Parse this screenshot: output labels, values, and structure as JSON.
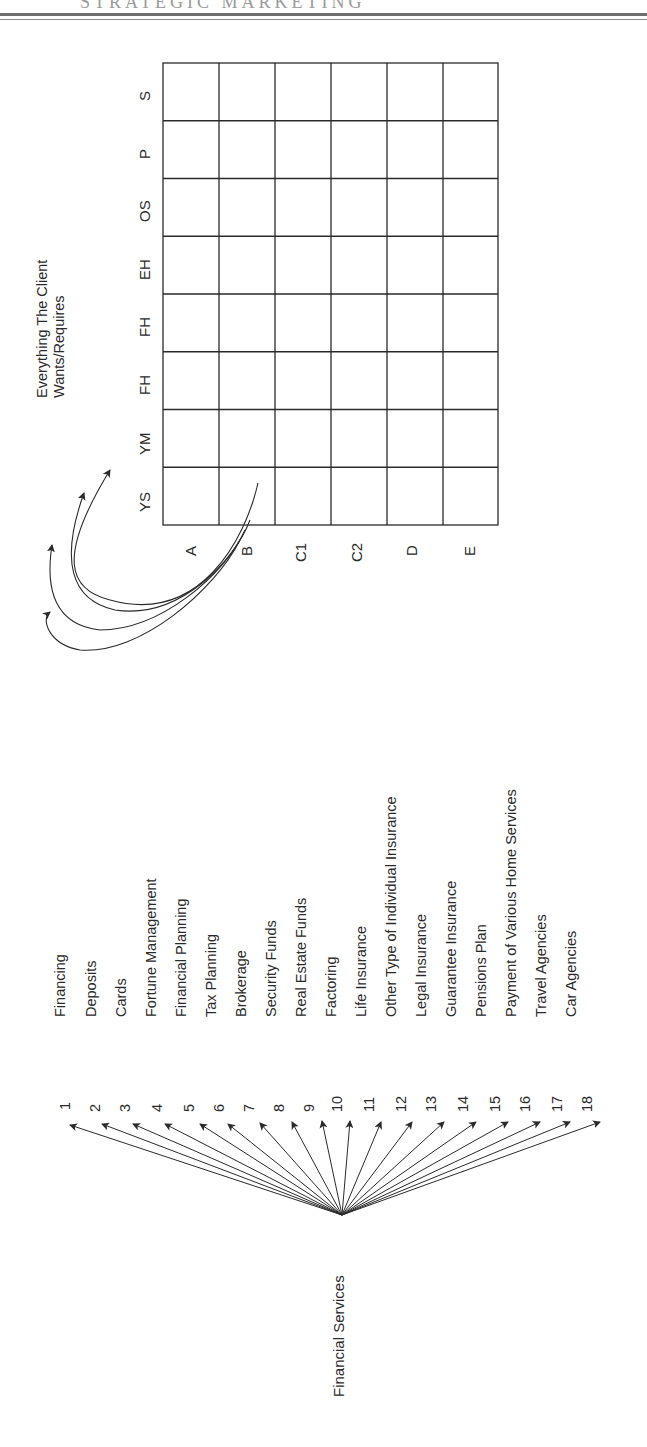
{
  "header": {
    "ghost_text": "STRATEGIC MARKETING"
  },
  "matrix": {
    "caption_line1": "Everything The Client",
    "caption_line2": "Wants/Requires",
    "row_labels": [
      "S",
      "P",
      "OS",
      "EH",
      "FH",
      "FH",
      "YM",
      "YS"
    ],
    "column_labels": [
      "A",
      "B",
      "C1",
      "C2",
      "D",
      "E"
    ]
  },
  "services": {
    "root_label": "Financial Services",
    "items": [
      {
        "number": "1",
        "label": "Financing"
      },
      {
        "number": "2",
        "label": "Deposits"
      },
      {
        "number": "3",
        "label": "Cards"
      },
      {
        "number": "4",
        "label": "Fortune Management"
      },
      {
        "number": "5",
        "label": "Financial Planning"
      },
      {
        "number": "6",
        "label": "Tax Planning"
      },
      {
        "number": "7",
        "label": "Brokerage"
      },
      {
        "number": "8",
        "label": "Security Funds"
      },
      {
        "number": "9",
        "label": "Real Estate Funds"
      },
      {
        "number": "10",
        "label": "Factoring"
      },
      {
        "number": "11",
        "label": "Life Insurance"
      },
      {
        "number": "12",
        "label": "Other Type of Individual Insurance"
      },
      {
        "number": "13",
        "label": "Legal Insurance"
      },
      {
        "number": "14",
        "label": "Guarantee Insurance"
      },
      {
        "number": "15",
        "label": "Pensions Plan"
      },
      {
        "number": "16",
        "label": "Payment of Various Home Services"
      },
      {
        "number": "17",
        "label": "Travel Agencies"
      },
      {
        "number": "18",
        "label": "Car Agencies"
      }
    ]
  },
  "colors": {
    "ink": "#2a2a2a",
    "background": "#ffffff"
  }
}
